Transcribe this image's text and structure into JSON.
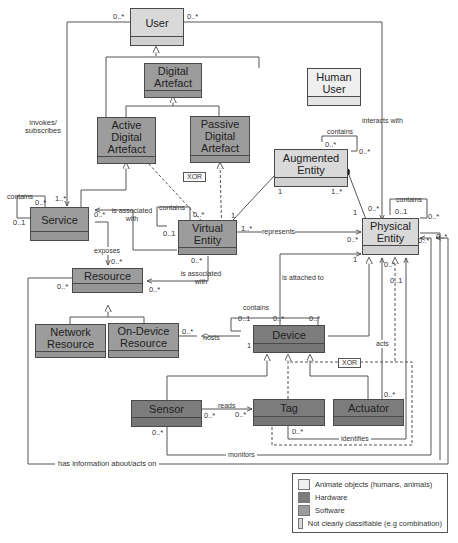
{
  "diagram": {
    "type": "UML class diagram",
    "classes": {
      "user": {
        "name": "User",
        "category": "mixed"
      },
      "digital_artefact": {
        "name": "Digital Artefact",
        "category": "software"
      },
      "human_user": {
        "name": "Human User",
        "category": "animate"
      },
      "active_digital_artefact": {
        "name": "Active Digital Artefact",
        "category": "software"
      },
      "passive_digital_artefact": {
        "name": "Passive Digital Artefact",
        "category": "software"
      },
      "augmented_entity": {
        "name": "Augmented Entity",
        "category": "mixed"
      },
      "service": {
        "name": "Service",
        "category": "software"
      },
      "virtual_entity": {
        "name": "Virtual Entity",
        "category": "software"
      },
      "physical_entity": {
        "name": "Physical Entity",
        "category": "mixed"
      },
      "resource": {
        "name": "Resource",
        "category": "software"
      },
      "network_resource": {
        "name": "Network Resource",
        "category": "software"
      },
      "on_device_resource": {
        "name": "On-Device Resource",
        "category": "software"
      },
      "device": {
        "name": "Device",
        "category": "hardware"
      },
      "sensor": {
        "name": "Sensor",
        "category": "hardware"
      },
      "tag": {
        "name": "Tag",
        "category": "hardware"
      },
      "actuator": {
        "name": "Actuator",
        "category": "hardware"
      }
    },
    "labels": {
      "invokes": "invokes/\nsubscribes",
      "interacts_with": "interacts with",
      "contains_ae": "contains",
      "contains_service": "contains",
      "contains_ve": "contains",
      "contains_pe": "contains",
      "contains_device": "contains",
      "is_associated_with_service": "is associated\nwith",
      "is_associated_with_resource": "is associated\nwith",
      "represents": "represents",
      "exposes": "exposes",
      "is_attached_to": "is attached to",
      "hosts": "hosts",
      "reads": "reads",
      "acts": "acts",
      "identifies": "identifies",
      "monitors": "monitors",
      "has_information": "has information about/acts on",
      "xor_1": "XOR",
      "xor_2": "XOR"
    },
    "multiplicities": {
      "user_left": "0..*",
      "user_right": "0..*",
      "ae_self_1": "0..*",
      "ae_self_2": "0..*",
      "service_contains_1": "0..*",
      "service_contains_2": "0..1",
      "service_invoke": "1..*",
      "service_assoc": "0..*",
      "ve_contains_1": "0..*",
      "ve_contains_2": "0..1",
      "ve_ae": "1",
      "ve_represents": "1..*",
      "ve_resource": "0..*",
      "ae_ve": "1",
      "ae_pe": "1..*",
      "pe_ae": "1",
      "pe_interacts": "0..*",
      "pe_self_1": "0..1",
      "pe_self_2": "0..*",
      "pe_represents": "0..*",
      "pe_attached": "1",
      "pe_right_1": "0..*",
      "pe_right_2": "0..*",
      "pe_below_1": "0..*",
      "pe_below_2": "0..1",
      "service_exposes": "0..*",
      "resource_left": "0..*",
      "resource_right": "0..*",
      "ondevice_hosts": "0..*",
      "device_contains_1": "0..1",
      "device_contains_2": "0..*",
      "device_attached": "0..*",
      "device_hosts": "1",
      "sensor_reads": "0..*",
      "tag_reads": "0..*",
      "sensor_monitors": "0..*",
      "tag_identifies": "0..*",
      "actuator_acts": "0..*"
    },
    "legend": [
      {
        "label": "Animate objects (humans, animals)",
        "color": "#efefef"
      },
      {
        "label": "Hardware",
        "color": "#7c7c7c"
      },
      {
        "label": "Software",
        "color": "#9c9c9c"
      },
      {
        "label": "Not clearly classifiable (e.g combination)",
        "color": "#d9d9d9"
      }
    ]
  }
}
